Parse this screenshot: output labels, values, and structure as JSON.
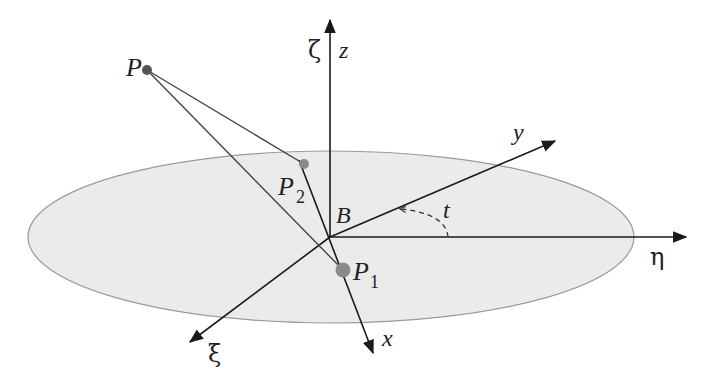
{
  "labels": {
    "P": "P",
    "P2": "P",
    "P2_sub": "2",
    "P1": "P",
    "P1_sub": "1",
    "B": "B",
    "t": "t",
    "x": "x",
    "y": "y",
    "z": "z",
    "zeta": "ζ",
    "eta": "η",
    "xi": "ξ"
  },
  "colors": {
    "plane_fill": "#ebebeb",
    "plane_stroke": "#9a9a9a",
    "axis": "#1a1a1a",
    "line": "#444444",
    "point": "#7a7a7a"
  }
}
